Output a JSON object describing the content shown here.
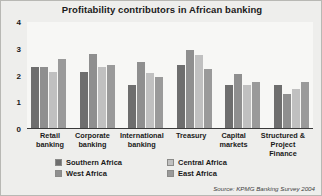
{
  "chart_data": {
    "type": "bar",
    "title": "Profitability contributors in African banking",
    "xlabel": "",
    "ylabel": "",
    "ylim": [
      0,
      4
    ],
    "yticks": [
      "0",
      "1",
      "2",
      "3",
      "4"
    ],
    "grid": false,
    "legend_position": "bottom",
    "categories": [
      "Retail banking",
      "Corporate banking",
      "International banking",
      "Treasury",
      "Capital markets",
      "Structured & Project Finance"
    ],
    "series": [
      {
        "name": "Southern Africa",
        "color": "#6e6e6e",
        "values": [
          2.3,
          2.15,
          1.65,
          2.4,
          1.65,
          1.65
        ]
      },
      {
        "name": "West Africa",
        "color": "#8f8f8f",
        "values": [
          2.3,
          2.8,
          2.5,
          2.95,
          2.05,
          1.3
        ]
      },
      {
        "name": "Central Africa",
        "color": "#c0c0c0",
        "values": [
          2.15,
          2.3,
          2.1,
          2.75,
          1.65,
          1.5
        ]
      },
      {
        "name": "East Africa",
        "color": "#9a9a9a",
        "values": [
          2.6,
          2.4,
          1.95,
          2.25,
          1.75,
          1.75
        ]
      }
    ],
    "source": "Source: KPMG Banking Survey 2004"
  },
  "legend": [
    {
      "label": "Southern Africa",
      "swatch": "#6e6e6e"
    },
    {
      "label": "Central Africa",
      "swatch": "#c0c0c0"
    },
    {
      "label": "West Africa",
      "swatch": "#8f8f8f"
    },
    {
      "label": "East Africa",
      "swatch": "#9a9a9a"
    }
  ]
}
